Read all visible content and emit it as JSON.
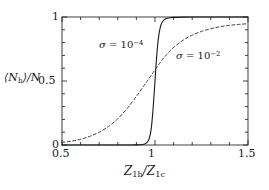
{
  "chart_data": {
    "type": "line",
    "title": "",
    "xlabel": "Z_1h/Z_1c",
    "ylabel": "<N_h>/N",
    "xlim": [
      0.5,
      1.5
    ],
    "ylim": [
      0.0,
      1.0
    ],
    "grid": false,
    "legend": "inline-annotations",
    "xticks": [
      0.5,
      1,
      1.5
    ],
    "xticklabels": [
      "0.5",
      "1",
      "1.5"
    ],
    "xminor_step": 0.1,
    "yticks": [
      0,
      0.5,
      1
    ],
    "yticklabels": [
      "0",
      "0.5",
      "1"
    ],
    "yminor_step": 0.1,
    "x": [
      0.5,
      0.55,
      0.6,
      0.65,
      0.7,
      0.75,
      0.8,
      0.85,
      0.9,
      0.92,
      0.94,
      0.95,
      0.96,
      0.97,
      0.98,
      0.99,
      1.0,
      1.01,
      1.02,
      1.03,
      1.04,
      1.05,
      1.06,
      1.08,
      1.1,
      1.15,
      1.2,
      1.25,
      1.3,
      1.35,
      1.4,
      1.45,
      1.5
    ],
    "series": [
      {
        "name": "sigma = 10^-4",
        "style": "solid",
        "color": "#1a1a1a",
        "annotation": "σ = 10⁻⁴",
        "values": [
          0.0,
          0.0,
          0.0,
          0.0,
          0.0,
          0.0,
          0.0,
          0.0,
          0.001,
          0.002,
          0.006,
          0.012,
          0.025,
          0.055,
          0.13,
          0.29,
          0.5,
          0.71,
          0.852,
          0.928,
          0.963,
          0.98,
          0.988,
          0.994,
          0.997,
          0.999,
          1.0,
          1.0,
          1.0,
          1.0,
          1.0,
          1.0,
          1.0
        ]
      },
      {
        "name": "sigma = 10^-2",
        "style": "dashed",
        "color": "#3a3a3a",
        "annotation": "σ = 10⁻²",
        "values": [
          0.02,
          0.03,
          0.045,
          0.068,
          0.1,
          0.145,
          0.205,
          0.285,
          0.38,
          0.42,
          0.462,
          0.483,
          0.503,
          0.524,
          0.545,
          0.566,
          0.587,
          0.608,
          0.628,
          0.648,
          0.667,
          0.685,
          0.702,
          0.734,
          0.762,
          0.818,
          0.858,
          0.887,
          0.908,
          0.924,
          0.935,
          0.942,
          0.948
        ]
      }
    ]
  },
  "axis": {
    "ylabel_main": "⟨N",
    "ylabel_sub": "h",
    "ylabel_tail": "⟩/N",
    "xlabel_z1": "Z",
    "xlabel_sub1": "1h",
    "xlabel_slash": "/",
    "xlabel_z2": "Z",
    "xlabel_sub2": "1c"
  },
  "ticks": {
    "x": [
      "0.5",
      "1",
      "1.5"
    ],
    "y": [
      "0",
      "0.5",
      "1"
    ]
  },
  "annotations": {
    "sigma_small": {
      "sym": "σ",
      "eq": " = 10",
      "exp": "−4"
    },
    "sigma_large": {
      "sym": "σ",
      "eq": " = 10",
      "exp": "−2"
    }
  }
}
